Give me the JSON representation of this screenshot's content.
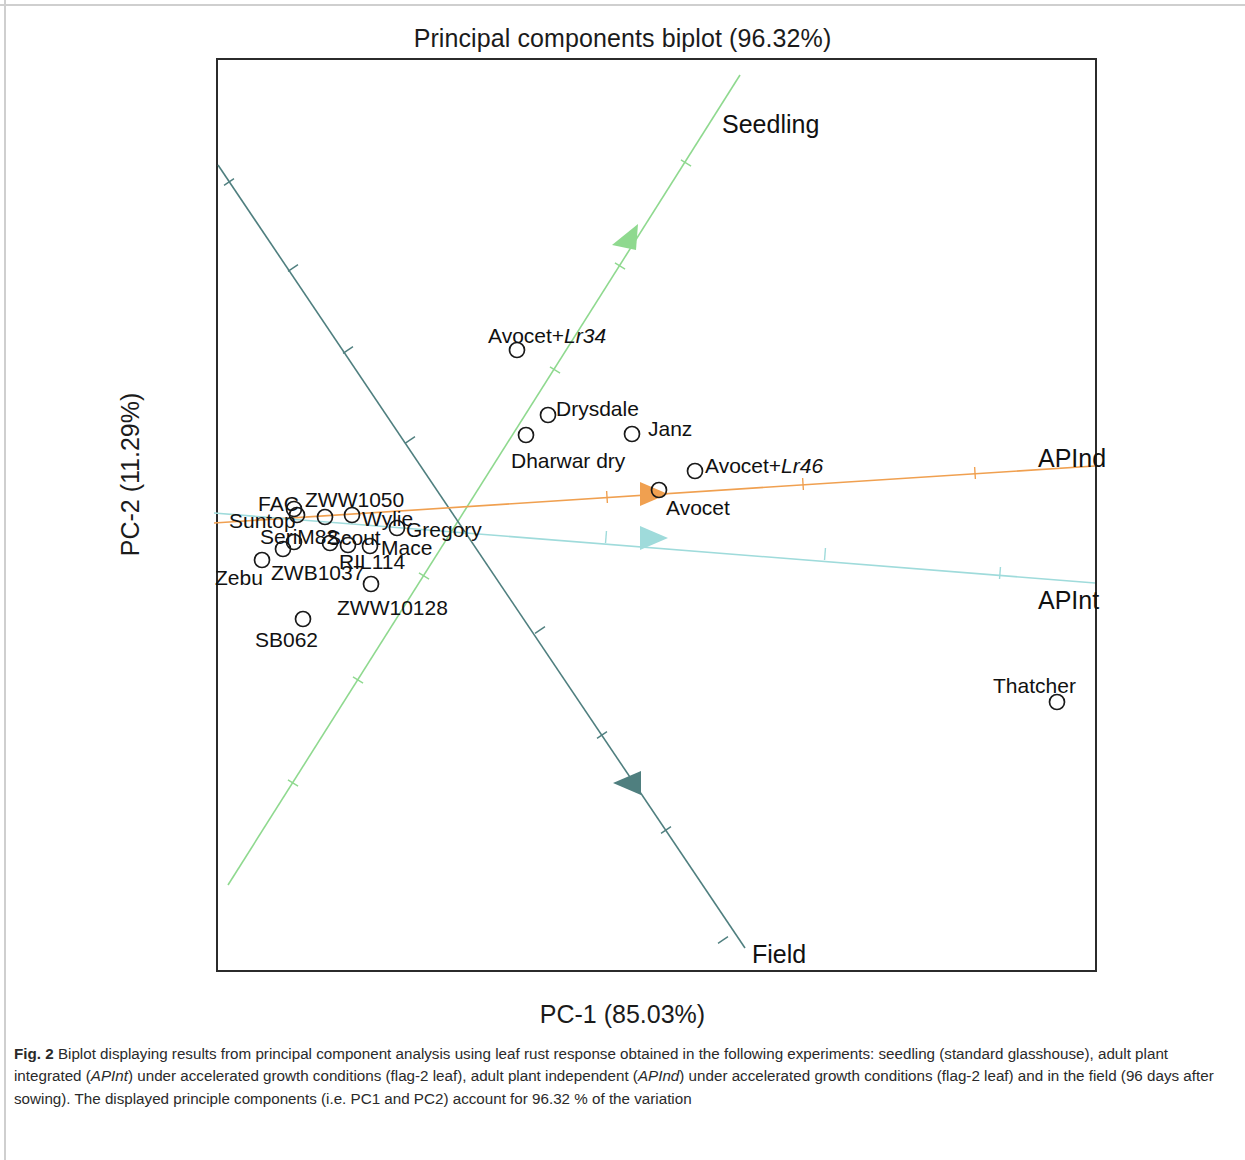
{
  "figure": {
    "title": "Principal components biplot (96.32%)",
    "x_axis_label": "PC-1 (85.03%)",
    "y_axis_label": "PC-2 (11.29%)",
    "caption_number": "Fig. 2",
    "caption_part1": " Biplot displaying results from principal component analysis using leaf rust response obtained in the following experiments: seedling (standard glasshouse), adult plant integrated (",
    "caption_apint": "APInt",
    "caption_part2": ") under accelerated growth conditions (flag-2 leaf), adult plant independent (",
    "caption_apind": "APInd",
    "caption_part3": ") under accelerated growth conditions (flag-2 leaf) and in the field (96 days after sowing). The displayed principle components (i.e. PC1 and PC2) account for 96.32 % of the variation"
  },
  "chart_data": {
    "type": "scatter",
    "title": "Principal components biplot (96.32%)",
    "xlabel": "PC-1 (85.03%)",
    "ylabel": "PC-2 (11.29%)",
    "variance_explained_total": "96.32%",
    "pc1_variance": "85.03%",
    "pc2_variance": "11.29%",
    "grid": false,
    "legend": "none",
    "origin_px": [
      455,
      513
    ],
    "points": [
      {
        "label": "Avocet+Lr34",
        "label_prefix": "Avocet+",
        "label_italic": "Lr34",
        "px": 517,
        "py": 350,
        "lx": 488,
        "ly": 325
      },
      {
        "label": "Drysdale",
        "label_prefix": "Drysdale",
        "label_italic": "",
        "px": 548,
        "py": 415,
        "lx": 556,
        "ly": 398
      },
      {
        "label": "Dharwar dry",
        "label_prefix": "Dharwar dry",
        "label_italic": "",
        "px": 526,
        "py": 435,
        "lx": 511,
        "ly": 450
      },
      {
        "label": "Janz",
        "label_prefix": "Janz",
        "label_italic": "",
        "px": 632,
        "py": 434,
        "lx": 648,
        "ly": 418
      },
      {
        "label": "Avocet+Lr46",
        "label_prefix": "Avocet+",
        "label_italic": "Lr46",
        "px": 695,
        "py": 471,
        "lx": 705,
        "ly": 455
      },
      {
        "label": "Avocet",
        "label_prefix": "Avocet",
        "label_italic": "",
        "px": 659,
        "py": 490,
        "lx": 666,
        "ly": 497
      },
      {
        "label": "FAC",
        "label_prefix": "FAC",
        "label_italic": "",
        "px": 294,
        "py": 509,
        "lx": 258,
        "ly": 493
      },
      {
        "label": "ZWW1050",
        "label_prefix": "ZWW1050",
        "label_italic": "",
        "px": 325,
        "py": 517,
        "lx": 305,
        "ly": 489
      },
      {
        "label": "Suntop",
        "label_prefix": "Suntop",
        "label_italic": "",
        "px": 297,
        "py": 515,
        "lx": 229,
        "ly": 510
      },
      {
        "label": "Wylie",
        "label_prefix": "Wylie",
        "label_italic": "",
        "px": 352,
        "py": 515,
        "lx": 362,
        "ly": 508
      },
      {
        "label": "Gregory",
        "label_prefix": "Gregory",
        "label_italic": "",
        "px": 397,
        "py": 528,
        "lx": 406,
        "ly": 519
      },
      {
        "label": "SeriM82",
        "label_prefix": "SeriM82",
        "label_italic": "",
        "px": 294,
        "py": 542,
        "lx": 260,
        "ly": 526
      },
      {
        "label": "Scout",
        "label_prefix": "Scout",
        "label_italic": "",
        "px": 330,
        "py": 543,
        "lx": 327,
        "ly": 527
      },
      {
        "label": "Mace",
        "label_prefix": "Mace",
        "label_italic": "",
        "px": 370,
        "py": 546,
        "lx": 381,
        "ly": 537
      },
      {
        "label": "ZWB1037",
        "label_prefix": "ZWB1037",
        "label_italic": "",
        "px": 283,
        "py": 549,
        "lx": 271,
        "ly": 562
      },
      {
        "label": "Zebu",
        "label_prefix": "Zebu",
        "label_italic": "",
        "px": 262,
        "py": 560,
        "lx": 215,
        "ly": 567
      },
      {
        "label": "RIL114",
        "label_prefix": "RIL114",
        "label_italic": "",
        "px": 348,
        "py": 545,
        "lx": 339,
        "ly": 551
      },
      {
        "label": "ZWW10128",
        "label_prefix": "ZWW10128",
        "label_italic": "",
        "px": 371,
        "py": 584,
        "lx": 337,
        "ly": 597
      },
      {
        "label": "SB062",
        "label_prefix": "SB062",
        "label_italic": "",
        "px": 303,
        "py": 619,
        "lx": 255,
        "ly": 629
      },
      {
        "label": "Thatcher",
        "label_prefix": "Thatcher",
        "label_italic": "",
        "px": 1057,
        "py": 702,
        "lx": 993,
        "ly": 675
      }
    ],
    "vectors": [
      {
        "name": "Seedling",
        "color": "#8fd98f",
        "x1": 228,
        "y1": 885,
        "x2": 740,
        "y2": 75,
        "arrow_x": 628,
        "arrow_y": 236,
        "arrow_dir": "down-left",
        "label_x": 722,
        "label_y": 112,
        "ticks": [
          [
            293,
            783
          ],
          [
            358,
            680
          ],
          [
            424,
            576
          ],
          [
            555,
            370
          ],
          [
            620,
            266
          ],
          [
            686,
            163
          ]
        ]
      },
      {
        "name": "Field",
        "color": "#4f7f7f",
        "x1": 218,
        "y1": 165,
        "x2": 745,
        "y2": 948,
        "arrow_x": 630,
        "arrow_y": 783,
        "arrow_dir": "left",
        "label_x": 752,
        "label_y": 942,
        "ticks": [
          [
            229,
            182
          ],
          [
            293,
            268
          ],
          [
            348,
            350
          ],
          [
            410,
            440
          ],
          [
            540,
            630
          ],
          [
            602,
            735
          ],
          [
            666,
            830
          ],
          [
            723,
            940
          ]
        ]
      },
      {
        "name": "APInd",
        "color": "#f0a050",
        "x1": 214,
        "y1": 523,
        "x2": 1095,
        "y2": 466,
        "arrow_x": 651,
        "arrow_y": 494,
        "arrow_dir": "right",
        "label_x": 1038,
        "label_y": 446,
        "ticks": [
          [
            607,
            497
          ],
          [
            803,
            484
          ],
          [
            975,
            473
          ]
        ]
      },
      {
        "name": "APInt",
        "color": "#9fdbdb",
        "x1": 214,
        "y1": 513,
        "x2": 1095,
        "y2": 583,
        "arrow_x": 651,
        "arrow_y": 538,
        "arrow_dir": "right",
        "label_x": 1038,
        "label_y": 588,
        "ticks": [
          [
            606,
            537
          ],
          [
            825,
            554
          ],
          [
            1000,
            573
          ]
        ]
      }
    ]
  }
}
